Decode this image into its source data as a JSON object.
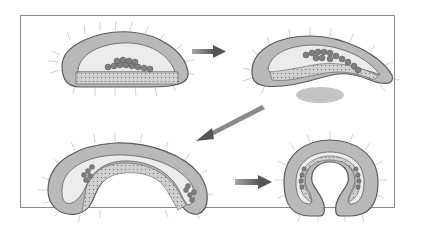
{
  "diagram": {
    "type": "developmental-sequence",
    "stages": [
      {
        "id": "stage-1",
        "description": "oval embryo with flat ventral cell layer and cluster of round cells"
      },
      {
        "id": "stage-2",
        "description": "elongated embryo, ventral layer curving inward, shaded region below"
      },
      {
        "id": "stage-3",
        "description": "embryo folding into S/arch shape with two cell clusters"
      },
      {
        "id": "stage-4",
        "description": "horseshoe-shaped embryo with inner layer folded"
      }
    ],
    "arrows": [
      {
        "from": "stage-1",
        "to": "stage-2",
        "direction": "right"
      },
      {
        "from": "stage-2",
        "to": "stage-3",
        "direction": "down-left"
      },
      {
        "from": "stage-3",
        "to": "stage-4",
        "direction": "right"
      }
    ],
    "colors": {
      "outer_cells": "#b9b9b9",
      "outline": "#5a5a5a",
      "cavity": "#ececec",
      "round_cells": "#7f7f7f",
      "inner_layer": "#cfcfcf",
      "arrow": "#6e6e6e",
      "shadow_blob": "#c4c4c4",
      "cilia": "#9a9a9a"
    }
  }
}
